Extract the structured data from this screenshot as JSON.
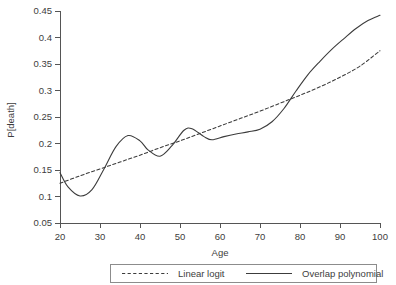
{
  "chart_data": {
    "type": "line",
    "title": "",
    "xlabel": "Age",
    "ylabel": "P[death]",
    "xlim": [
      20,
      100
    ],
    "ylim": [
      0.05,
      0.45
    ],
    "grid": false,
    "legend_position": "bottom-center",
    "x_ticks": [
      20,
      30,
      40,
      50,
      60,
      70,
      80,
      90,
      100
    ],
    "x_tick_labels": [
      "20",
      "30",
      "40",
      "50",
      "60",
      "70",
      "80",
      "90",
      "100"
    ],
    "y_ticks": [
      0.05,
      0.1,
      0.15,
      0.2,
      0.25,
      0.3,
      0.35,
      0.4,
      0.45
    ],
    "y_tick_labels": [
      "0.05",
      "0.1",
      "0.15",
      "0.2",
      "0.25",
      "0.3",
      "0.35",
      "0.4",
      "0.45"
    ],
    "series": [
      {
        "name": "Linear logit",
        "style": "dashed",
        "color": "#3c3c3c",
        "x": [
          20,
          25,
          30,
          35,
          40,
          45,
          50,
          55,
          60,
          65,
          70,
          75,
          80,
          85,
          90,
          95,
          100
        ],
        "values": [
          0.125,
          0.139,
          0.152,
          0.165,
          0.178,
          0.192,
          0.205,
          0.219,
          0.233,
          0.247,
          0.261,
          0.276,
          0.291,
          0.307,
          0.325,
          0.346,
          0.375
        ]
      },
      {
        "name": "Overlap polynomial",
        "style": "solid",
        "color": "#3c3c3c",
        "x": [
          20,
          22,
          25,
          28,
          31,
          34,
          37,
          40,
          42,
          45,
          48,
          51,
          53,
          56,
          58,
          61,
          64,
          67,
          70,
          73,
          76,
          79,
          82,
          85,
          88,
          91,
          94,
          97,
          100
        ],
        "values": [
          0.145,
          0.118,
          0.101,
          0.113,
          0.152,
          0.194,
          0.215,
          0.205,
          0.188,
          0.176,
          0.196,
          0.225,
          0.228,
          0.213,
          0.207,
          0.213,
          0.218,
          0.222,
          0.227,
          0.241,
          0.266,
          0.299,
          0.33,
          0.355,
          0.378,
          0.398,
          0.417,
          0.432,
          0.442
        ]
      }
    ],
    "legend_entries": [
      {
        "label": "Linear logit",
        "style": "dashed"
      },
      {
        "label": "Overlap polynomial",
        "style": "solid"
      }
    ]
  }
}
